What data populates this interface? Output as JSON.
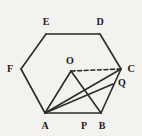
{
  "figure": {
    "type": "geometry-diagram",
    "background_color": "#f4f2ef",
    "stroke_color": "#2b2b2b",
    "dashed_stroke_color": "#2b2b2b",
    "label_color": "#1a1a1a",
    "points": [
      {
        "id": "A",
        "label": "A",
        "x": 45,
        "y": 113,
        "label_x": 45,
        "label_y": 126
      },
      {
        "id": "B",
        "label": "B",
        "x": 101,
        "y": 113,
        "label_x": 102,
        "label_y": 126
      },
      {
        "id": "C",
        "label": "C",
        "x": 121,
        "y": 69,
        "label_x": 131,
        "label_y": 69
      },
      {
        "id": "D",
        "label": "D",
        "x": 100,
        "y": 34,
        "label_x": 100,
        "label_y": 22
      },
      {
        "id": "E",
        "label": "E",
        "x": 46,
        "y": 34,
        "label_x": 46,
        "label_y": 22
      },
      {
        "id": "F",
        "label": "F",
        "x": 21,
        "y": 69,
        "label_x": 10,
        "label_y": 69
      },
      {
        "id": "O",
        "label": "O",
        "x": 71,
        "y": 71,
        "label_x": 70,
        "label_y": 61
      },
      {
        "id": "P",
        "label": "P",
        "x": 84,
        "y": 113,
        "label_x": 84,
        "label_y": 126
      },
      {
        "id": "Q",
        "label": "Q",
        "x": 113,
        "y": 84,
        "label_x": 122,
        "label_y": 83
      }
    ],
    "segments": [
      {
        "name": "hexagon-side-AB",
        "from": "A",
        "to": "B",
        "style": "solid"
      },
      {
        "name": "hexagon-side-BC",
        "from": "B",
        "to": "C",
        "style": "solid"
      },
      {
        "name": "hexagon-side-CD",
        "from": "C",
        "to": "D",
        "style": "solid"
      },
      {
        "name": "hexagon-side-DE",
        "from": "D",
        "to": "E",
        "style": "solid"
      },
      {
        "name": "hexagon-side-EF",
        "from": "E",
        "to": "F",
        "style": "solid"
      },
      {
        "name": "hexagon-side-FA",
        "from": "F",
        "to": "A",
        "style": "solid"
      },
      {
        "name": "segment-OA",
        "from": "O",
        "to": "A",
        "style": "solid"
      },
      {
        "name": "segment-OB",
        "from": "O",
        "to": "B",
        "style": "solid"
      },
      {
        "name": "segment-OC",
        "from": "O",
        "to": "C",
        "style": "dashed"
      },
      {
        "name": "segment-AC",
        "from": "A",
        "to": "C",
        "style": "solid"
      },
      {
        "name": "segment-AQ",
        "from": "A",
        "to": "Q",
        "style": "solid"
      }
    ],
    "labels_order": [
      "E",
      "D",
      "F",
      "O",
      "C",
      "Q",
      "A",
      "P",
      "B"
    ]
  }
}
